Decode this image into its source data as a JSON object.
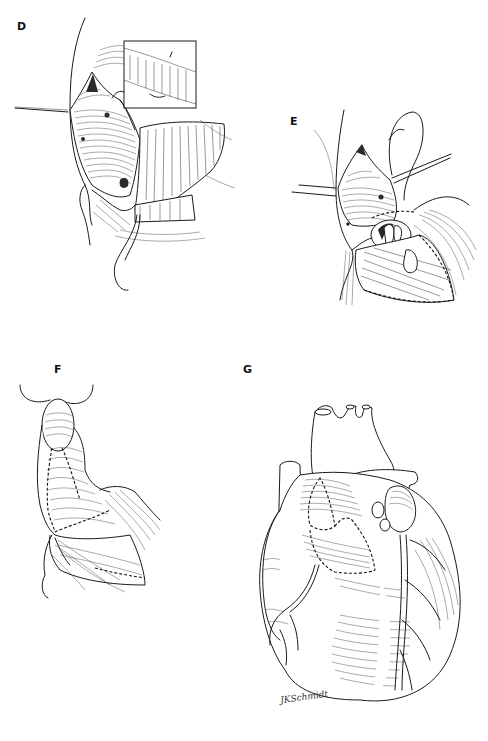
{
  "figure": {
    "type": "surgical illustration",
    "background": "#ffffff",
    "ink_color": "#1a1a1a",
    "panels": [
      {
        "id": "D",
        "label": "D",
        "content": "Opened right atrium with retracted flap and inset detail of suture line; retraction sutures"
      },
      {
        "id": "E",
        "label": "E",
        "content": "Atriotomy exposing valve orifice with retraction sutures and flap"
      },
      {
        "id": "F",
        "label": "F",
        "content": "Sutured patch reconstruction with running suture line"
      },
      {
        "id": "G",
        "label": "G",
        "content": "Anterior view of heart with completed patch repair and great vessels",
        "signature": "JKSchmidt"
      }
    ]
  }
}
